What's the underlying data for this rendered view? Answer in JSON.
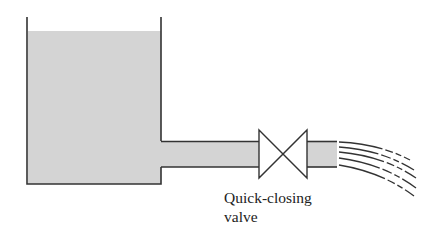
{
  "diagram": {
    "components": {
      "tank": "reservoir-tank",
      "water": "water",
      "pipe": "outlet-pipe",
      "valve": "quick-closing-valve",
      "jet": "outflow-jet"
    },
    "labels": {
      "valve_line1": "Quick-closing",
      "valve_line2": "valve"
    },
    "colors": {
      "water_fill": "#d4d4d4",
      "outline": "#333333",
      "background": "#ffffff"
    }
  }
}
